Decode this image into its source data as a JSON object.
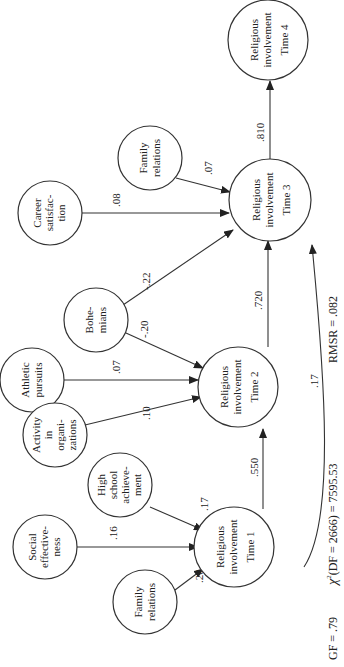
{
  "diagram": {
    "orientation": "rotated-90-ccw",
    "nodes": {
      "family_relations_top": {
        "lines": [
          "Family",
          "relations"
        ]
      },
      "career_satisfaction": {
        "lines": [
          "Career",
          "satisfac-",
          "tion"
        ]
      },
      "ri_time4": {
        "lines": [
          "Religious",
          "involvement",
          "Time 4"
        ]
      },
      "ri_time3": {
        "lines": [
          "Religious",
          "involvement",
          "Time 3"
        ]
      },
      "bohemians": {
        "lines": [
          "Bohe-",
          "mians"
        ]
      },
      "athletic_pursuits": {
        "lines": [
          "Athletic",
          "pursuits"
        ]
      },
      "activity_organizations": {
        "lines": [
          "Activity",
          "in",
          "organi-",
          "zations"
        ]
      },
      "ri_time2": {
        "lines": [
          "Religious",
          "involvement",
          "Time 2"
        ]
      },
      "high_school_achievement": {
        "lines": [
          "High",
          "school",
          "achieve-",
          "ment"
        ]
      },
      "social_effectiveness": {
        "lines": [
          "Social",
          "effective-",
          "ness"
        ]
      },
      "family_relations_bottom": {
        "lines": [
          "Family",
          "relations"
        ]
      },
      "ri_time1": {
        "lines": [
          "Religious",
          "involvement",
          "Time 1"
        ]
      }
    },
    "edges": {
      "family_top_to_t3": ".07",
      "career_to_t3": ".08",
      "t3_to_t4": ".810",
      "bohemians_to_t3": "-.22",
      "bohemians_to_t2": "-.20",
      "athletic_to_t2": ".07",
      "activity_to_t2": ".10",
      "t2_to_t3": ".720",
      "t1_to_t3": ".17",
      "hs_to_t1": ".17",
      "social_to_t1": ".16",
      "family_bottom_to_t1": ".20",
      "t1_to_t2": ".550"
    },
    "fit": {
      "gf": "GF = .79",
      "chi_symbol": "χ",
      "chi_sup": "2",
      "chi_rest": "(DF = 2666) = 7595.53",
      "rmsr": "RMSR = .082"
    }
  }
}
